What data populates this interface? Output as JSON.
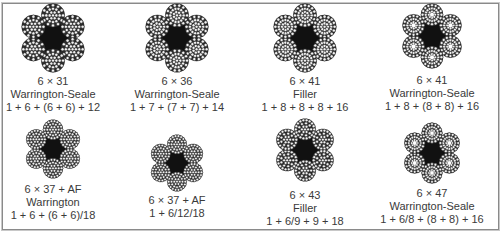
{
  "figure": {
    "type": "wire-rope-cross-sections",
    "colors": {
      "strand_wire_stroke": "#222222",
      "core_fill": "#111111",
      "text": "#3a3a3a",
      "border": "#8a8a8a"
    },
    "items": [
      {
        "construction": "6 × 31",
        "type": "Warrington-Seale",
        "formula": "1 + 6 + (6 + 6) + 12"
      },
      {
        "construction": "6 × 36",
        "type": "Warrington-Seale",
        "formula": "1 + 7 + (7 + 7) + 14"
      },
      {
        "construction": "6 × 41",
        "type": "Filler",
        "formula": "1 + 8 + 8 + 8 + 16"
      },
      {
        "construction": "6 × 41",
        "type": "Warrington-Seale",
        "formula": "1 + 8 + (8 + 8) + 16"
      },
      {
        "construction": "6 × 37 + AF",
        "type": "Warrington",
        "formula": "1 + 6 + (6 + 6)/18"
      },
      {
        "construction": "6 × 37 + AF",
        "type": "",
        "formula": "1 + 6/12/18"
      },
      {
        "construction": "6 × 43",
        "type": "Filler",
        "formula": "1 + 6/9 + 9 + 18"
      },
      {
        "construction": "6 × 47",
        "type": "Warrington-Seale",
        "formula": "1 + 6/8 + (8 + 8) + 16"
      }
    ]
  }
}
